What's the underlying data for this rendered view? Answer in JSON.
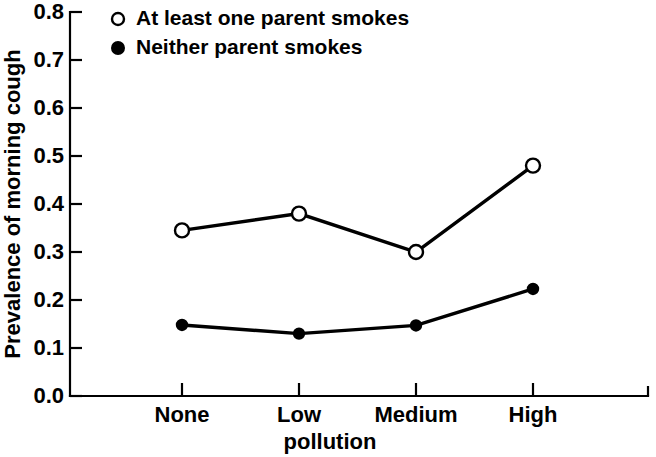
{
  "chart_data": {
    "type": "line",
    "title": "",
    "subtitle": "",
    "xlabel": "pollution",
    "ylabel": "Prevalence of morning cough",
    "categories": [
      "None",
      "Low",
      "Medium",
      "High"
    ],
    "x": [
      1,
      2,
      3,
      4
    ],
    "series": [
      {
        "name": "At least one parent smokes",
        "marker": "open-circle",
        "values": [
          0.345,
          0.38,
          0.3,
          0.48
        ]
      },
      {
        "name": "Neither parent smokes",
        "marker": "filled-circle",
        "values": [
          0.148,
          0.13,
          0.147,
          0.223
        ]
      }
    ],
    "ylim": [
      0.0,
      0.8
    ],
    "ytick_labels": [
      "0.0",
      "0.1",
      "0.2",
      "0.3",
      "0.4",
      "0.5",
      "0.6",
      "0.7",
      "0.8"
    ],
    "ytick_values": [
      0.0,
      0.1,
      0.2,
      0.3,
      0.4,
      0.5,
      0.6,
      0.7,
      0.8
    ],
    "grid": false,
    "legend_position": "top-left-inside",
    "line_color": "#000000",
    "background_color": "#ffffff"
  },
  "legend": {
    "items": [
      {
        "label": "At least one parent smokes",
        "marker": "open-circle"
      },
      {
        "label": "Neither parent smokes",
        "marker": "filled-circle"
      }
    ]
  },
  "axes": {
    "y_title": "Prevalence of morning cough",
    "x_title": "pollution",
    "y_ticks": [
      "0.8",
      "0.7",
      "0.6",
      "0.5",
      "0.4",
      "0.3",
      "0.2",
      "0.1",
      "0.0"
    ],
    "x_ticks": [
      "None",
      "Low",
      "Medium",
      "High"
    ]
  }
}
